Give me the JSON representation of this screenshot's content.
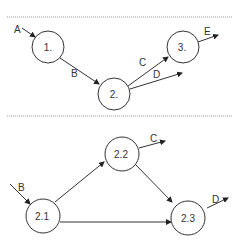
{
  "diagram": {
    "top": {
      "nodes": [
        {
          "id": "n1",
          "label": "1.",
          "cx": 48,
          "cy": 47,
          "r": 16
        },
        {
          "id": "n2",
          "label": "2.",
          "cx": 114,
          "cy": 94,
          "r": 16
        },
        {
          "id": "n3",
          "label": "3.",
          "cx": 183,
          "cy": 47,
          "r": 16
        }
      ],
      "edges": [
        {
          "label": "A",
          "from": "input",
          "to": "1."
        },
        {
          "label": "B",
          "from": "1.",
          "to": "2."
        },
        {
          "label": "C",
          "from": "2.",
          "to": "3."
        },
        {
          "label": "D",
          "from": "2.",
          "to": "output"
        },
        {
          "label": "E",
          "from": "3.",
          "to": "output"
        }
      ]
    },
    "bottom": {
      "nodes": [
        {
          "id": "n21",
          "label": "2.1",
          "cx": 43,
          "cy": 214,
          "r": 17
        },
        {
          "id": "n22",
          "label": "2.2",
          "cx": 122,
          "cy": 152,
          "r": 17
        },
        {
          "id": "n23",
          "label": "2.3",
          "cx": 190,
          "cy": 214,
          "r": 17
        }
      ],
      "edges": [
        {
          "label": "B",
          "from": "input",
          "to": "2.1"
        },
        {
          "label": "",
          "from": "2.1",
          "to": "2.2"
        },
        {
          "label": "",
          "from": "2.1",
          "to": "2.3"
        },
        {
          "label": "",
          "from": "2.2",
          "to": "2.3"
        },
        {
          "label": "C",
          "from": "2.2",
          "to": "output"
        },
        {
          "label": "D",
          "from": "2.3",
          "to": "output"
        }
      ]
    },
    "colors": {
      "stroke": "#333333",
      "divider": "#999999"
    }
  }
}
